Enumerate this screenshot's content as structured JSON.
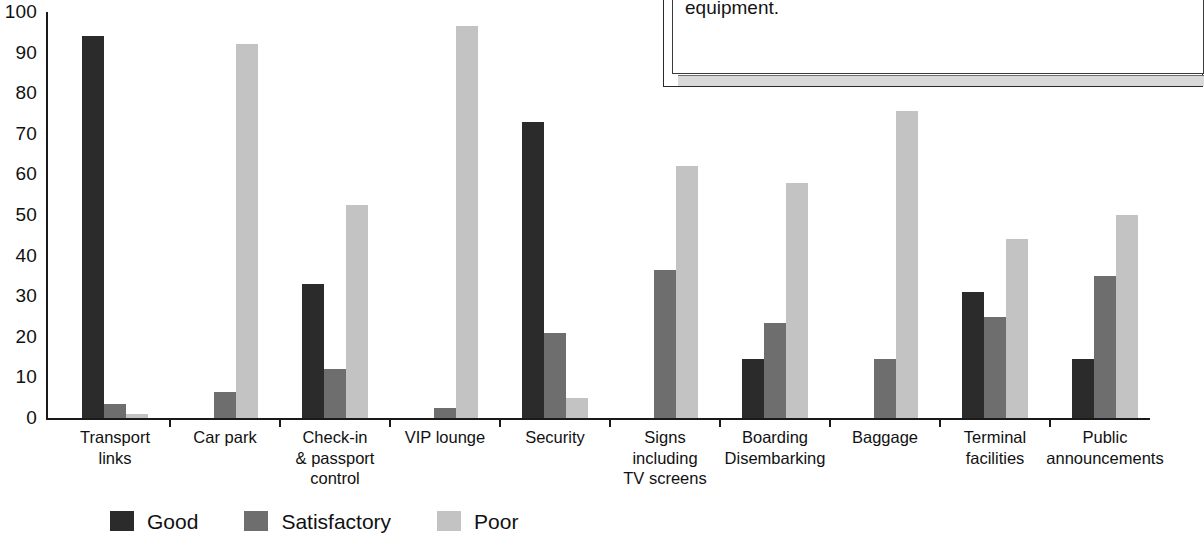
{
  "chart_data": {
    "type": "bar",
    "title": "",
    "xlabel": "",
    "ylabel": "",
    "ylim": [
      0,
      100
    ],
    "yticks": [
      0,
      10,
      20,
      30,
      40,
      50,
      60,
      70,
      80,
      90,
      100
    ],
    "ytick_labels": [
      "0",
      "10",
      "20",
      "30",
      "40",
      "50",
      "60",
      "70",
      "80",
      "90",
      "100"
    ],
    "grid": false,
    "legend_position": "bottom-left",
    "categories": [
      "Transport\nlinks",
      "Car park",
      "Check-in\n& passport\ncontrol",
      "VIP lounge",
      "Security",
      "Signs\nincluding\nTV screens",
      "Boarding\nDisembarking",
      "Baggage",
      "Terminal\nfacilities",
      "Public\nannouncements"
    ],
    "series": [
      {
        "name": "Good",
        "color": "#2b2b2b",
        "values": [
          94,
          0,
          33,
          0,
          73,
          0,
          14.5,
          0,
          31,
          14.5
        ]
      },
      {
        "name": "Satisfactory",
        "color": "#6e6e6e",
        "values": [
          3.5,
          6.5,
          12,
          2.5,
          21,
          36.5,
          23.5,
          14.5,
          25,
          35
        ]
      },
      {
        "name": "Poor",
        "color": "#c3c3c3",
        "values": [
          1,
          92,
          52.5,
          96.5,
          5,
          62,
          58,
          75.5,
          44,
          50
        ]
      }
    ]
  },
  "legend": {
    "items": [
      {
        "label": "Good",
        "swatch": "dark-swatch"
      },
      {
        "label": "Satisfactory",
        "swatch": "medium-gray-swatch"
      },
      {
        "label": "Poor",
        "swatch": "light-gray-swatch"
      }
    ]
  },
  "note_box": {
    "text": "improving communications than investing in expens\nequipment."
  }
}
